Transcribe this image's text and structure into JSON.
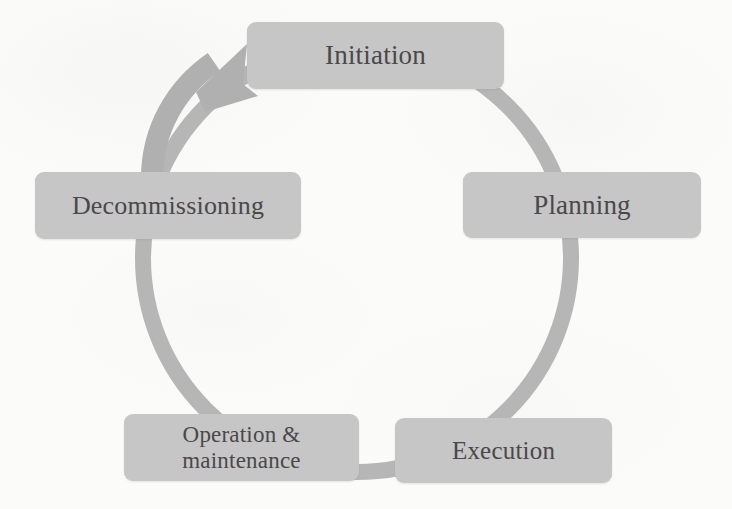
{
  "diagram": {
    "type": "cycle",
    "background_color": "#fbfbfa",
    "node_fill_color": "#c6c6c6",
    "node_text_color": "#494949",
    "ring_color": "#b6b6b6",
    "arrow_color": "#b0b0b0",
    "direction": "clockwise",
    "ring": {
      "center_x": 357,
      "center_y": 258,
      "radius": 214,
      "stroke_width": 16
    },
    "nodes": [
      {
        "id": "initiation",
        "label": "Initiation",
        "position": "top"
      },
      {
        "id": "planning",
        "label": "Planning",
        "position": "upper-right"
      },
      {
        "id": "execution",
        "label": "Execution",
        "position": "bottom-right"
      },
      {
        "id": "operation",
        "label": "Operation &\nmaintenance",
        "position": "bottom-left"
      },
      {
        "id": "decommissioning",
        "label": "Decommissioning",
        "position": "upper-left"
      }
    ],
    "arrow": {
      "name": "cycle-return-arrow",
      "from_node": "decommissioning",
      "to_node": "initiation",
      "description": "curved arrow sweeping up-right from Decommissioning to Initiation"
    }
  }
}
